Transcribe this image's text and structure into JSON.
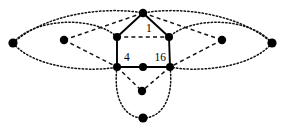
{
  "figure": {
    "background_color": "#ffffff",
    "node_color": "#000000",
    "edge_color": "#000000",
    "width": 286,
    "height": 130
  },
  "labels": {
    "top": "1",
    "left": "4",
    "right": "16"
  },
  "nodes": [
    {
      "id": "top",
      "name": "node-top",
      "x": 143,
      "y": 13,
      "r": 4.2
    },
    {
      "id": "upper-left",
      "name": "node-upper-left",
      "x": 117,
      "y": 37,
      "r": 4.0
    },
    {
      "id": "upper-right",
      "name": "node-upper-right",
      "x": 169,
      "y": 37,
      "r": 4.0
    },
    {
      "id": "bottom-left",
      "name": "node-bottom-left",
      "x": 117,
      "y": 67,
      "r": 4.0
    },
    {
      "id": "bottom-mid",
      "name": "node-bottom-mid",
      "x": 143,
      "y": 67,
      "r": 4.0
    },
    {
      "id": "bottom-right",
      "name": "node-bottom-right",
      "x": 170,
      "y": 67,
      "r": 4.0
    },
    {
      "id": "inner-left",
      "name": "node-inner-left",
      "x": 64,
      "y": 40,
      "r": 4.2
    },
    {
      "id": "inner-right",
      "name": "node-inner-right",
      "x": 222,
      "y": 40,
      "r": 4.2
    },
    {
      "id": "far-left",
      "name": "node-far-left",
      "x": 13,
      "y": 43,
      "r": 4.6
    },
    {
      "id": "far-right",
      "name": "node-far-right",
      "x": 272,
      "y": 43,
      "r": 4.6
    },
    {
      "id": "lower-mid",
      "name": "node-lower-mid",
      "x": 142,
      "y": 91,
      "r": 4.2
    },
    {
      "id": "lower-bottom",
      "name": "node-lower-bottom",
      "x": 143,
      "y": 118,
      "r": 4.6
    }
  ],
  "edges": [
    {
      "name": "edge-top-upper-left",
      "style": "solid",
      "from": "top",
      "to": "upper-left"
    },
    {
      "name": "edge-top-upper-right",
      "style": "solid",
      "from": "top",
      "to": "upper-right"
    },
    {
      "name": "edge-upper-left-bottom-left",
      "style": "solid",
      "from": "upper-left",
      "to": "bottom-left"
    },
    {
      "name": "edge-upper-right-bottom-right",
      "style": "solid",
      "from": "upper-right",
      "to": "bottom-right"
    },
    {
      "name": "edge-bottom-left-bottom-mid",
      "style": "solid",
      "from": "bottom-left",
      "to": "bottom-mid"
    },
    {
      "name": "edge-bottom-mid-bottom-right",
      "style": "solid",
      "from": "bottom-mid",
      "to": "bottom-right"
    },
    {
      "name": "edge-top-inner-left",
      "style": "dashed",
      "from": "top",
      "to": "inner-left"
    },
    {
      "name": "edge-top-inner-right",
      "style": "dashed",
      "from": "top",
      "to": "inner-right"
    },
    {
      "name": "edge-inner-left-bottom-left",
      "style": "dashed",
      "from": "inner-left",
      "to": "bottom-left"
    },
    {
      "name": "edge-inner-right-bottom-right",
      "style": "dashed",
      "from": "inner-right",
      "to": "bottom-right"
    },
    {
      "name": "edge-upper-left-upper-right",
      "style": "dashed",
      "from": "upper-left",
      "to": "upper-right"
    },
    {
      "name": "edge-bottom-left-lower-mid",
      "style": "dashed",
      "from": "bottom-left",
      "to": "lower-mid"
    },
    {
      "name": "edge-bottom-right-lower-mid",
      "style": "dashed",
      "from": "bottom-right",
      "to": "lower-mid"
    }
  ],
  "curves": [
    {
      "name": "curve-left-ellipse-upper",
      "style": "dotted",
      "d": "M 13 43 C 35 17, 95 16, 117 37"
    },
    {
      "name": "curve-left-ellipse-lower",
      "style": "dotted",
      "d": "M 13 43 C 35 70, 95 72, 117 67"
    },
    {
      "name": "curve-right-ellipse-upper",
      "style": "dotted",
      "d": "M 272 43 C 250 17, 192 16, 169 37"
    },
    {
      "name": "curve-right-ellipse-lower",
      "style": "dotted",
      "d": "M 272 43 C 250 70, 192 72, 170 67"
    },
    {
      "name": "curve-bottom-loop-left",
      "style": "dotted",
      "d": "M 117 67 C 113 98, 124 118, 143 118"
    },
    {
      "name": "curve-bottom-loop-right",
      "style": "dotted",
      "d": "M 170 67 C 174 98, 162 118, 143 118"
    },
    {
      "name": "curve-top-arc-left",
      "style": "dotted",
      "d": "M 13 43 C 45 14, 105 6, 143 13"
    },
    {
      "name": "curve-top-arc-right",
      "style": "dotted",
      "d": "M 272 43 C 240 14, 181 6, 143 13"
    }
  ],
  "label_positions": [
    {
      "key": "top",
      "name": "label-1",
      "x": 146,
      "y": 29,
      "anchor": "start"
    },
    {
      "key": "left",
      "name": "label-4",
      "x": 124,
      "y": 58,
      "anchor": "start"
    },
    {
      "key": "right",
      "name": "label-16",
      "x": 166,
      "y": 58,
      "anchor": "end"
    }
  ]
}
